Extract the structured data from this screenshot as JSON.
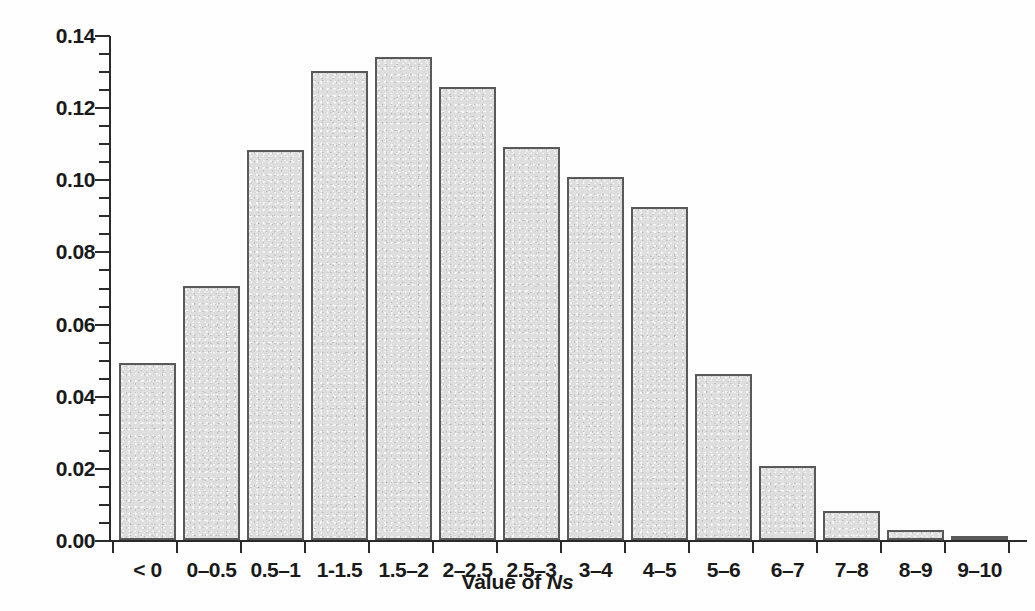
{
  "chart_data": {
    "type": "bar",
    "title": "",
    "xlabel": "Value of Ns",
    "xlabel_prefix": "Value of ",
    "xlabel_symbol": "Ns",
    "ylabel": "Proportion of fixations",
    "categories": [
      "< 0",
      "0–0.5",
      "0.5–1",
      "1-1.5",
      "1.5–2",
      "2–2.5",
      "2.5–3",
      "3–4",
      "4–5",
      "5–6",
      "6–7",
      "7–8",
      "8–9",
      "9–10"
    ],
    "values": [
      0.049,
      0.0705,
      0.108,
      0.13,
      0.134,
      0.1255,
      0.109,
      0.1005,
      0.0922,
      0.0461,
      0.0205,
      0.008,
      0.0027,
      0.001
    ],
    "ylim": [
      0.0,
      0.14
    ],
    "xlim_note": "categorical",
    "ytick_labels": [
      "0.00",
      "0.02",
      "0.04",
      "0.06",
      "0.08",
      "0.10",
      "0.12",
      "0.14"
    ],
    "ytick_values": [
      0.0,
      0.02,
      0.04,
      0.06,
      0.08,
      0.1,
      0.12,
      0.14
    ],
    "yminor_step": 0.005,
    "grid": false,
    "legend": null,
    "bar_fill_color": "#dedede",
    "bar_edge_color": "#595959",
    "axis_color": "#2a2a2a",
    "background_color": "#ffffff"
  }
}
